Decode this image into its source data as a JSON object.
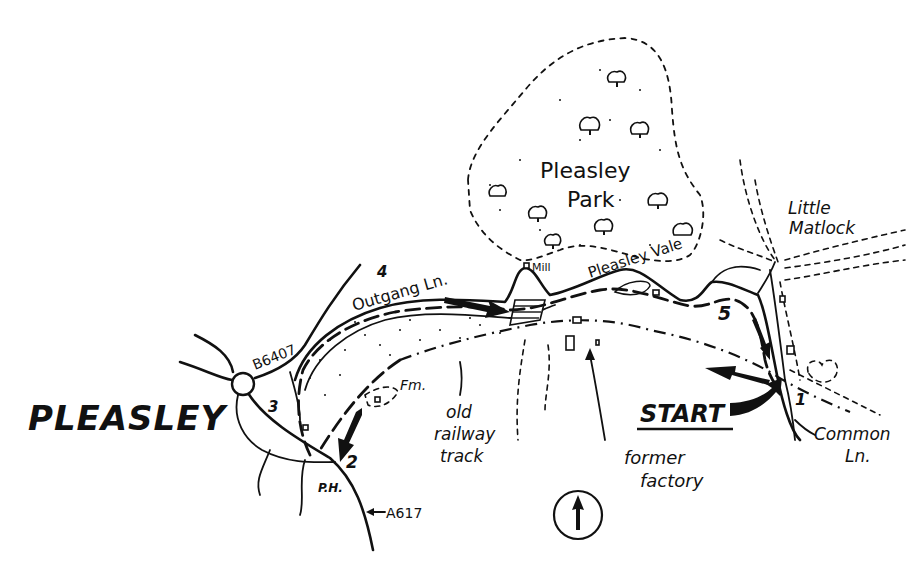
{
  "map": {
    "title": "Pleasley walk route map",
    "places": {
      "town": "PLEASLEY",
      "park_line1": "Pleasley",
      "park_line2": "Park",
      "vale": "Pleasley Vale",
      "hamlet_line1": "Little",
      "hamlet_line2": "Matlock",
      "mill": "Mill",
      "farm": "Fm.",
      "pub": "P.H."
    },
    "roads": {
      "b_road": "B6407",
      "a_road": "A617",
      "outgang": "Outgang Ln.",
      "common_line1": "Common",
      "common_line2": "Ln."
    },
    "features": {
      "railway_line1": "old",
      "railway_line2": "railway",
      "railway_line3": "track",
      "factory_line1": "former",
      "factory_line2": "factory"
    },
    "start_label": "START",
    "waypoints": [
      {
        "id": "1",
        "label": "1"
      },
      {
        "id": "2",
        "label": "2"
      },
      {
        "id": "3",
        "label": "3"
      },
      {
        "id": "4",
        "label": "4"
      },
      {
        "id": "5",
        "label": "5"
      }
    ],
    "compass": {
      "direction": "north-arrow-icon"
    },
    "colors": {
      "ink": "#111111",
      "paper": "#ffffff"
    }
  }
}
